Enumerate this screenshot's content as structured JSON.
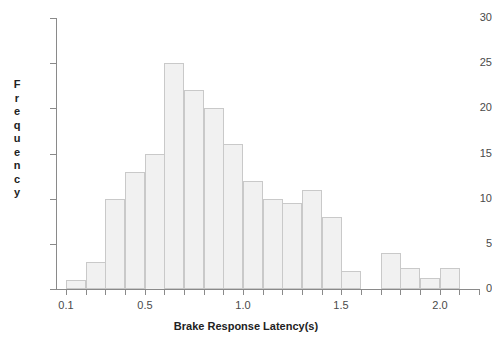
{
  "chart_data": {
    "type": "bar",
    "title": "",
    "xlabel": "Brake Response Latency(s)",
    "ylabel": "Frequency",
    "grid": false,
    "legend": null,
    "bin_width": 0.1,
    "xlim": [
      0.05,
      2.2
    ],
    "ylim": [
      0,
      30
    ],
    "x_tick_labels": [
      "0.1",
      "0.5",
      "1.0",
      "1.5",
      "2.0"
    ],
    "x_tick_values": [
      0.1,
      0.5,
      1.0,
      1.5,
      2.0
    ],
    "y_tick_labels": [
      "0",
      "5",
      "10",
      "15",
      "20",
      "25",
      "30"
    ],
    "y_tick_values": [
      0,
      5,
      10,
      15,
      20,
      25,
      30
    ],
    "bin_edges": [
      0.1,
      0.2,
      0.3,
      0.4,
      0.5,
      0.6,
      0.7,
      0.8,
      0.9,
      1.0,
      1.1,
      1.2,
      1.3,
      1.4,
      1.5,
      1.6,
      1.7,
      1.8,
      1.9,
      2.0,
      2.1,
      2.2
    ],
    "categories": [
      "0.1-0.2",
      "0.2-0.3",
      "0.3-0.4",
      "0.4-0.5",
      "0.5-0.6",
      "0.6-0.7",
      "0.7-0.8",
      "0.8-0.9",
      "0.9-1.0",
      "1.0-1.1",
      "1.1-1.2",
      "1.2-1.3",
      "1.3-1.4",
      "1.4-1.5",
      "1.5-1.6",
      "1.6-1.7",
      "1.7-1.8",
      "1.8-1.9",
      "1.9-2.0",
      "2.0-2.1",
      "2.1-2.2"
    ],
    "values": [
      1,
      3,
      10,
      13,
      15,
      25,
      22,
      20,
      16,
      12,
      10,
      9.5,
      11,
      8,
      2,
      0,
      4,
      2.3,
      1.2,
      2.3,
      0
    ],
    "bar_fill_color": "#f1f1f1",
    "bar_edge_color": "#c9c9c9",
    "axis_color": "#8a8a8a"
  },
  "axis": {
    "y_title_letters": [
      "F",
      "r",
      "e",
      "q",
      "u",
      "e",
      "n",
      "c",
      "y"
    ]
  }
}
